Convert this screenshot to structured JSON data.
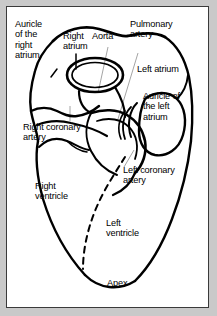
{
  "figure": {
    "frame_color": "#3a3a3a",
    "background": "#ffffff",
    "page_background": "#c9c9c9",
    "line_color": "#000000",
    "leader_color": "#9a9a9a",
    "text_color": "#000000"
  },
  "labels": {
    "auricle_right_atrium": "Auricle\nof the\nright\natrium",
    "right_atrium": "Right\natrium",
    "aorta": "Aorta",
    "pulmonary_artery": "Pulmonary\nartery",
    "left_atrium": "Left atrium",
    "auricle_left_atrium": "Auricle of\nthe left\natrium",
    "right_coronary_artery": "Right coronary\nartery",
    "left_coronary_artery": "Left coronary\nartery",
    "right_ventricle": "Right\nventricle",
    "left_ventricle": "Left\nventricle",
    "apex": "Apex"
  },
  "structures": [
    {
      "name": "auricle-of-right-atrium",
      "kind": "chamber-appendage"
    },
    {
      "name": "right-atrium",
      "kind": "chamber"
    },
    {
      "name": "aorta",
      "kind": "great-vessel"
    },
    {
      "name": "pulmonary-artery",
      "kind": "great-vessel"
    },
    {
      "name": "left-atrium",
      "kind": "chamber"
    },
    {
      "name": "auricle-of-left-atrium",
      "kind": "chamber-appendage"
    },
    {
      "name": "right-coronary-artery",
      "kind": "vessel"
    },
    {
      "name": "left-coronary-artery",
      "kind": "vessel"
    },
    {
      "name": "right-ventricle",
      "kind": "chamber"
    },
    {
      "name": "left-ventricle",
      "kind": "chamber"
    },
    {
      "name": "apex",
      "kind": "landmark"
    }
  ]
}
